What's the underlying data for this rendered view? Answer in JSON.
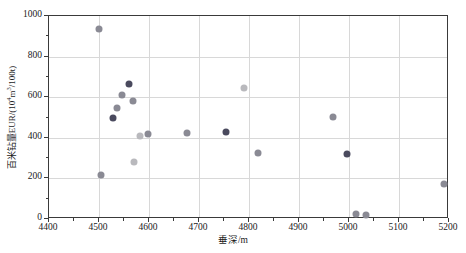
{
  "chart_data": {
    "type": "scatter",
    "title": "",
    "xlabel": "垂深/m",
    "ylabel_html": "百米钻量EUR/(10<sup>4</sup>m<sup>3</sup>/100t)",
    "ylabel_text": "百米钻量EUR/(10^4m^3/100t)",
    "xlim": [
      4400,
      5200
    ],
    "ylim": [
      0,
      1000
    ],
    "xticks": [
      4400,
      4500,
      4600,
      4700,
      4800,
      4900,
      5000,
      5100,
      5200
    ],
    "xticklabels": [
      "4400",
      "4500",
      "4600",
      "4700",
      "4800",
      "4900",
      "5000",
      "5100",
      "5200"
    ],
    "yticks": [
      0,
      200,
      400,
      600,
      800,
      1000
    ],
    "yticklabels": [
      "0",
      "200",
      "400",
      "600",
      "800",
      "1000"
    ],
    "y_minor_ticks": [
      100,
      300,
      500,
      700,
      900
    ],
    "x_minor_ticks": [
      4450,
      4550,
      4650,
      4750,
      4850,
      4950,
      5050,
      5150
    ],
    "grid": true,
    "grid_color": "#d8d8d8",
    "legend": null,
    "marker_size_px": 7,
    "colors": {
      "dark": "#4a4a5e",
      "medium": "#8a8a94",
      "light": "#b9b9bd",
      "axis": "#3a3a3a",
      "background": "#ffffff"
    },
    "points": [
      {
        "x": 4500,
        "y": 936,
        "shade": "medium"
      },
      {
        "x": 4503,
        "y": 219,
        "shade": "medium"
      },
      {
        "x": 4527,
        "y": 500,
        "shade": "dark"
      },
      {
        "x": 4536,
        "y": 547,
        "shade": "medium"
      },
      {
        "x": 4545,
        "y": 612,
        "shade": "medium"
      },
      {
        "x": 4560,
        "y": 663,
        "shade": "dark"
      },
      {
        "x": 4568,
        "y": 582,
        "shade": "medium"
      },
      {
        "x": 4570,
        "y": 283,
        "shade": "light"
      },
      {
        "x": 4581,
        "y": 411,
        "shade": "light"
      },
      {
        "x": 4598,
        "y": 421,
        "shade": "medium"
      },
      {
        "x": 4675,
        "y": 426,
        "shade": "medium"
      },
      {
        "x": 4754,
        "y": 430,
        "shade": "dark"
      },
      {
        "x": 4789,
        "y": 645,
        "shade": "light"
      },
      {
        "x": 4817,
        "y": 327,
        "shade": "medium"
      },
      {
        "x": 4968,
        "y": 503,
        "shade": "medium"
      },
      {
        "x": 4995,
        "y": 320,
        "shade": "dark"
      },
      {
        "x": 5013,
        "y": 26,
        "shade": "medium"
      },
      {
        "x": 5033,
        "y": 20,
        "shade": "medium"
      },
      {
        "x": 5190,
        "y": 174,
        "shade": "medium"
      }
    ]
  }
}
